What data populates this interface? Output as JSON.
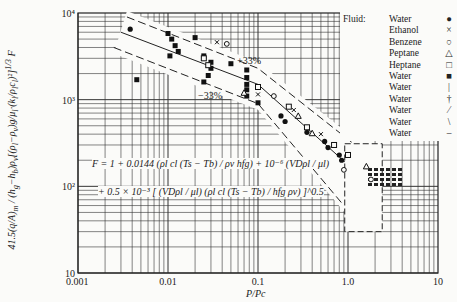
{
  "chart_data": {
    "type": "scatter",
    "title": "",
    "xlabel": "P/Pc",
    "ylabel": "41.5(q/A)m / ((hg - hb) ρv [ (ρl - ρv) g / μl (kl / ρl cl)^2 ]^(1/3)) F",
    "xscale": "log",
    "yscale": "log",
    "xlim": [
      0.001,
      10
    ],
    "ylim": [
      10,
      10000
    ],
    "x_ticks": [
      "0.001",
      "0.01",
      "0.1",
      "1.0",
      "10"
    ],
    "y_ticks": [
      "10",
      "10²",
      "10³",
      "10⁴"
    ],
    "grid": true,
    "legend_position": "top-right",
    "legend_title": "Fluid:",
    "legend": [
      {
        "name": "Water",
        "symbol": "filled-circle"
      },
      {
        "name": "Ethanol",
        "symbol": "cross"
      },
      {
        "name": "Benzene",
        "symbol": "open-circle"
      },
      {
        "name": "Peptane",
        "symbol": "open-triangle"
      },
      {
        "name": "Heptane",
        "symbol": "open-square"
      },
      {
        "name": "Water",
        "symbol": "filled-square"
      },
      {
        "name": "Water",
        "symbol": "vertical-bar"
      },
      {
        "name": "Water",
        "symbol": "dagger"
      },
      {
        "name": "Water",
        "symbol": "slash"
      },
      {
        "name": "Water",
        "symbol": "backslash"
      },
      {
        "name": "Water",
        "symbol": "dash"
      }
    ],
    "band_lines": [
      {
        "label": "+33%",
        "points": [
          [
            0.0035,
            9000
          ],
          [
            0.1,
            2300
          ],
          [
            1.5,
            250
          ]
        ]
      },
      {
        "label": "center",
        "points": [
          [
            0.003,
            6000
          ],
          [
            0.1,
            1500
          ],
          [
            1.2,
            150
          ]
        ]
      },
      {
        "label": "-33%",
        "points": [
          [
            0.0025,
            4000
          ],
          [
            0.1,
            900
          ],
          [
            0.9,
            60
          ]
        ]
      }
    ],
    "annotations": [
      "+33%",
      "-33%"
    ],
    "series": [
      {
        "name": "Water (filled square)",
        "points": [
          [
            0.0045,
            1700
          ],
          [
            0.01,
            5800
          ],
          [
            0.011,
            5000
          ],
          [
            0.012,
            4200
          ],
          [
            0.013,
            3600
          ],
          [
            0.0105,
            3200
          ],
          [
            0.02,
            5200
          ],
          [
            0.025,
            3200
          ],
          [
            0.03,
            2700
          ],
          [
            0.03,
            2300
          ],
          [
            0.028,
            1900
          ],
          [
            0.025,
            1600
          ],
          [
            0.05,
            2600
          ],
          [
            0.075,
            2200
          ],
          [
            0.075,
            1800
          ],
          [
            0.075,
            1500
          ],
          [
            0.075,
            1300
          ],
          [
            0.075,
            1100
          ],
          [
            0.1,
            920
          ]
        ]
      },
      {
        "name": "Water (filled circle)",
        "points": [
          [
            0.0038,
            6500
          ],
          [
            0.18,
            650
          ],
          [
            0.2,
            560
          ],
          [
            0.35,
            420
          ],
          [
            0.55,
            330
          ],
          [
            0.6,
            280
          ],
          [
            0.8,
            230
          ],
          [
            0.85,
            200
          ]
        ]
      },
      {
        "name": "Ethanol",
        "points": [
          [
            0.035,
            4600
          ],
          [
            0.1,
            1150
          ],
          [
            0.25,
            760
          ],
          [
            0.5,
            400
          ]
        ]
      },
      {
        "name": "Benzene",
        "points": [
          [
            0.045,
            4400
          ],
          [
            0.15,
            1100
          ],
          [
            0.9,
            155
          ],
          [
            1.8,
            120
          ]
        ]
      },
      {
        "name": "Peptane",
        "points": [
          [
            0.07,
            1200
          ],
          [
            0.28,
            650
          ],
          [
            0.4,
            410
          ],
          [
            1.6,
            170
          ]
        ]
      },
      {
        "name": "Heptane",
        "points": [
          [
            0.025,
            3000
          ],
          [
            0.028,
            2500
          ],
          [
            0.1,
            1400
          ],
          [
            0.22,
            830
          ],
          [
            0.35,
            480
          ],
          [
            0.7,
            300
          ],
          [
            1.0,
            230
          ]
        ]
      }
    ],
    "dashed_box": {
      "x": [
        0.92,
        2.4
      ],
      "y": [
        30,
        310
      ]
    }
  },
  "formula": {
    "line1": "F = 1 + 0.0144 (ρl cl (Ts − Tb) / ρv hfg) + 10⁻⁶ (VDρl / μl)",
    "line2": "+ 0.5 × 10⁻³ [ (VDρl / μl) (ρl cl (Ts − Tb) / hfg ρv) ]^0.5"
  },
  "labels": {
    "plus": "+33%",
    "minus": "−33%",
    "xlabel": "P/Pc",
    "F": "F"
  }
}
